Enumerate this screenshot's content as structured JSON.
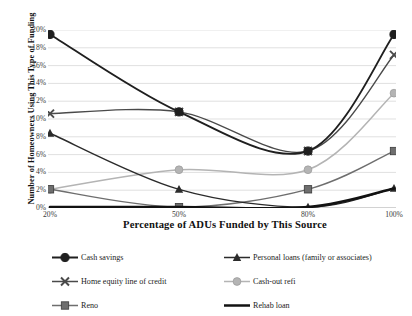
{
  "chart_data": {
    "type": "line",
    "title": "",
    "xlabel": "Percentage of ADUs Funded by This Source",
    "ylabel": "Number of Homeowners Using This Type of Funding",
    "x": [
      20,
      50,
      80,
      100
    ],
    "categories": [
      "20%",
      "50%",
      "80%",
      "100%"
    ],
    "ylim": [
      0,
      20
    ],
    "xlim": [
      20,
      100
    ],
    "ytick_labels": [
      "0%",
      "2%",
      "4%",
      "6%",
      "8%",
      "10%",
      "12%",
      "14%",
      "16%",
      "18%",
      "20%"
    ],
    "ytick_values": [
      0,
      2,
      4,
      6,
      8,
      10,
      12,
      14,
      16,
      18,
      20
    ],
    "grid": "horizontal",
    "smoothing": "spline",
    "legend_position": "bottom",
    "series": [
      {
        "name": "Cash savings",
        "marker": "circle-filled",
        "color": "#1f1f1f",
        "line_width": 1.9,
        "values": [
          19.5,
          10.8,
          6.4,
          19.5
        ]
      },
      {
        "name": "Personal loans (family or associates)",
        "marker": "triangle",
        "color": "#2b2b2b",
        "line_width": 1.4,
        "values": [
          8.4,
          2.1,
          0.1,
          2.2
        ]
      },
      {
        "name": "Home equity line of credit",
        "marker": "x",
        "color": "#4a4a4a",
        "line_width": 1.4,
        "values": [
          10.6,
          10.8,
          6.4,
          17.2
        ]
      },
      {
        "name": "Cash-out refi",
        "marker": "circle",
        "color": "#b4b4b4",
        "line_width": 1.5,
        "values": [
          2.1,
          4.3,
          4.3,
          12.9
        ]
      },
      {
        "name": "Reno",
        "marker": "square",
        "color": "#6e6e6e",
        "line_width": 1.4,
        "values": [
          2.1,
          0.1,
          2.1,
          6.4
        ]
      },
      {
        "name": "Rehab loan",
        "marker": "none",
        "color": "#121212",
        "line_width": 2.6,
        "values": [
          0.1,
          0.1,
          0.1,
          2.2
        ]
      }
    ]
  },
  "axes": {
    "y_title": "Number of Homeowners Using This Type of Funding",
    "x_title": "Percentage of ADUs Funded by This Source"
  },
  "legend": {
    "entries": [
      {
        "label": "Cash savings",
        "marker": "circle-filled",
        "color": "#1f1f1f"
      },
      {
        "label": "Personal loans (family or associates)",
        "marker": "triangle",
        "color": "#2b2b2b"
      },
      {
        "label": "Home equity line of credit",
        "marker": "x",
        "color": "#4a4a4a"
      },
      {
        "label": "Cash-out refi",
        "marker": "circle",
        "color": "#b4b4b4"
      },
      {
        "label": "Reno",
        "marker": "square",
        "color": "#6e6e6e"
      },
      {
        "label": "Rehab loan",
        "marker": "none",
        "color": "#121212"
      }
    ]
  },
  "colors": {
    "grid": "#d2d2d2",
    "axis": "#9a9a9a",
    "text": "#1a1a1a"
  }
}
